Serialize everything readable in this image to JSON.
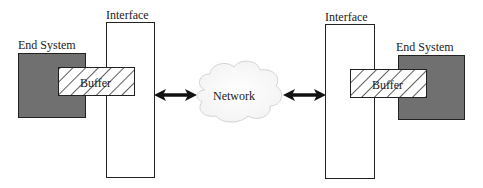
{
  "diagram": {
    "left": {
      "end_system_label": "End System",
      "interface_label": "Interface",
      "buffer_label": "Buffer"
    },
    "center": {
      "network_label": "Network"
    },
    "right": {
      "end_system_label": "End System",
      "interface_label": "Interface",
      "buffer_label": "Buffer"
    },
    "colors": {
      "end_system_fill": "#707070",
      "outline": "#222222",
      "hatch": "#333333"
    }
  }
}
